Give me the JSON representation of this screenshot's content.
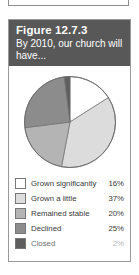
{
  "figure": {
    "title": "Figure 12.7.3",
    "subtitle": "By 2010, our church will have..."
  },
  "chart_data": {
    "type": "pie",
    "title": "Figure 12.7.3",
    "subtitle": "By 2010, our church will have...",
    "categories": [
      "Grown significantly",
      "Grown a little",
      "Remained stable",
      "Declined",
      "Closed"
    ],
    "values": [
      16,
      37,
      20,
      25,
      2
    ],
    "value_labels": [
      "16%",
      "37%",
      "20%",
      "25%",
      "2%"
    ],
    "colors": [
      "#ffffff",
      "#dcdcdc",
      "#b4b4b4",
      "#8c8c8c",
      "#5e5e5e"
    ],
    "legend_position": "bottom",
    "start_angle_deg": 0,
    "direction": "clockwise",
    "units": "percent"
  },
  "legend": [
    {
      "label": "Grown significantly",
      "value": "16%",
      "color": "#ffffff"
    },
    {
      "label": "Grown a little",
      "value": "37%",
      "color": "#dcdcdc"
    },
    {
      "label": "Remained stable",
      "value": "20%",
      "color": "#b4b4b4"
    },
    {
      "label": "Declined",
      "value": "25%",
      "color": "#8c8c8c"
    },
    {
      "label": "Closed",
      "value": "2%",
      "color": "#5e5e5e"
    }
  ]
}
